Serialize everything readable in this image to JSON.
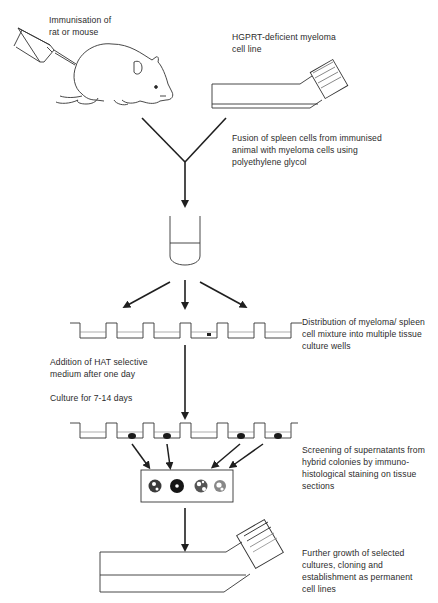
{
  "diagram": {
    "type": "flowchart",
    "colors": {
      "ink": "#2a2a2a",
      "background": "#ffffff",
      "stain": "#1a1a1a"
    },
    "labels": {
      "immunisation": "Immunisation of\nrat or mouse",
      "myeloma": "HGPRT-deficient myeloma\ncell line",
      "fusion": "Fusion of spleen cells from immunised\nanimal with myeloma cells using\npolyethylene glycol",
      "distribution": "Distribution of myeloma/ spleen\ncell mixture into multiple tissue\nculture wells",
      "hat": "Addition of HAT selective\nmedium after one day",
      "culture": "Culture for 7-14 days",
      "screening": "Screening of supernatants from\nhybrid colonies by immuno-\nhistological staining on tissue\nsections",
      "growth": "Further growth of selected\ncultures, cloning and\nestablishment as permanent\ncell lines"
    },
    "icons": [
      "syringe-icon",
      "rat-icon",
      "culture-flask-icon",
      "test-tube-icon",
      "well-plate-icon",
      "tissue-section-slide-icon"
    ],
    "steps": [
      {
        "id": "immunisation",
        "icon": "rat-icon"
      },
      {
        "id": "myeloma",
        "icon": "culture-flask-icon"
      },
      {
        "id": "fusion",
        "icon": "test-tube-icon"
      },
      {
        "id": "distribution",
        "icon": "well-plate-icon",
        "wells": 6,
        "colonies_in_wells": [
          4
        ]
      },
      {
        "id": "hat",
        "icon": null
      },
      {
        "id": "culture",
        "icon": "well-plate-icon",
        "wells": 6,
        "colonies_in_wells": [
          1,
          2,
          4,
          5
        ]
      },
      {
        "id": "screening",
        "icon": "tissue-section-slide-icon",
        "stained_sections": 4
      },
      {
        "id": "growth",
        "icon": "culture-flask-icon"
      }
    ]
  }
}
